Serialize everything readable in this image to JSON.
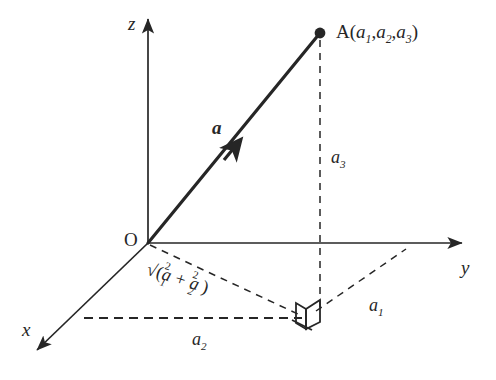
{
  "figure": {
    "background_color": "#ffffff",
    "ink_color": "#262626",
    "width": 496,
    "height": 380
  },
  "axes": {
    "z": {
      "label": "z",
      "arrow": "up",
      "tip": [
        148,
        14
      ],
      "origin": [
        148,
        243
      ]
    },
    "y": {
      "label": "y",
      "arrow": "right",
      "tip": [
        468,
        243
      ],
      "origin": [
        148,
        243
      ]
    },
    "x": {
      "label": "x",
      "arrow": "down-left",
      "tip": [
        30,
        356
      ],
      "origin": [
        148,
        243
      ]
    }
  },
  "origin": {
    "label": "O",
    "position": [
      148,
      243
    ]
  },
  "point": {
    "name": "A",
    "label_prefix": "A(",
    "label_suffix": ")",
    "coordinates": [
      "a",
      "a",
      "a"
    ],
    "subscripts": [
      "1",
      "2",
      "3"
    ],
    "separator": ",",
    "position": [
      320,
      33
    ],
    "marker": "filled-dot"
  },
  "vector": {
    "label": "a",
    "style": "bold-italic",
    "from": [
      148,
      243
    ],
    "to": [
      320,
      33
    ],
    "arrowhead_at_midpoint": [
      234,
      149
    ],
    "stroke_width": 3
  },
  "components": {
    "a1": {
      "label": "a",
      "subscript": "1",
      "position": [
        374,
        300
      ],
      "description": "x-component, dashed line from foot of perpendicular to y-axis"
    },
    "a2": {
      "label": "a",
      "subscript": "2",
      "position": [
        197,
        338
      ],
      "description": "y-component, horizontal dashed line along base"
    },
    "a3": {
      "label": "a",
      "subscript": "3",
      "position": [
        332,
        150
      ],
      "description": "z-component, vertical dashed line from A down to base plane"
    }
  },
  "radical": {
    "text_parts": {
      "radical_sign": "√",
      "open_paren": "(",
      "first_var": "a",
      "first_sub": "1",
      "first_sup": "2",
      "plus": "+",
      "second_var": "a",
      "second_sub": "2",
      "second_sup": "2",
      "close_paren": ")"
    },
    "plain_text": "√(a₁² + a₂²)",
    "position": [
      152,
      263
    ],
    "rotation_degrees": 17.5,
    "description": "length of the projection of a onto the xy-plane"
  },
  "right_angle_marker": {
    "position": [
      305,
      316
    ],
    "description": "3D right-angle corner symbol at the foot of the perpendicular"
  },
  "dashed_lines": [
    {
      "name": "vertical-drop",
      "from": [
        320,
        33
      ],
      "to": [
        320,
        316
      ]
    },
    {
      "name": "base-diagonal",
      "from": [
        148,
        243
      ],
      "to": [
        303,
        316
      ]
    },
    {
      "name": "base-horizontal",
      "from": [
        85,
        318
      ],
      "to": [
        303,
        318
      ]
    },
    {
      "name": "a1-to-y-axis",
      "from": [
        314,
        312
      ],
      "to": [
        405,
        250
      ]
    }
  ]
}
